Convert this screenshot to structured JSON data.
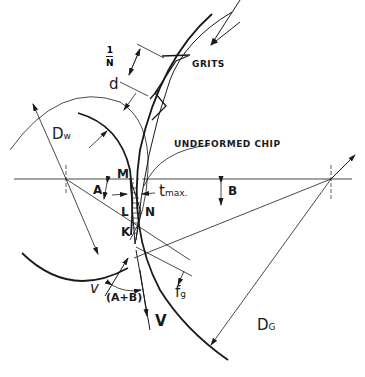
{
  "diagram": {
    "type": "grinding geometry (undeformed chip in surface/cylindrical grinding)",
    "labels": {
      "grits": "GRITS",
      "one_over_n_num": "1",
      "one_over_n_den": "N",
      "undeformed_chip": "UNDEFORMED CHIP",
      "d": "d",
      "dw_main": "D",
      "dw_sub": "w",
      "dg_main": "D",
      "dg_sub": "G",
      "point_m": "M",
      "point_l": "L",
      "point_n": "N",
      "point_k": "K",
      "angle_a": "A",
      "angle_b": "B",
      "tmax_main": "t",
      "tmax_sub": "max.",
      "fg_main": "f",
      "fg_sub": "g",
      "v_lower": "v",
      "a_plus_b": "(A+B)",
      "v_upper": "V"
    },
    "colors": {
      "ink": "#1a1a1a",
      "background": "#ffffff"
    }
  }
}
